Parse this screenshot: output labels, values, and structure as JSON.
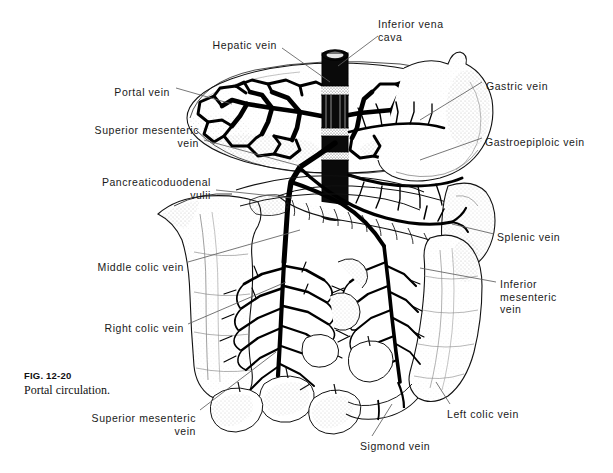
{
  "figure": {
    "number": "FIG. 12-20",
    "title": "Portal circulation."
  },
  "colors": {
    "ink": "#000000",
    "background": "#ffffff",
    "leader": "#6b6b6b",
    "stipple": "#5a5a5a"
  },
  "labels": [
    {
      "id": "inferior-vena-cava",
      "text": "Inferior vena\ncava",
      "x": 378,
      "y": 18,
      "align": "left"
    },
    {
      "id": "hepatic-vein",
      "text": "Hepatic vein",
      "x": 277,
      "y": 39,
      "align": "right"
    },
    {
      "id": "portal-vein",
      "text": "Portal vein",
      "x": 170,
      "y": 86,
      "align": "right"
    },
    {
      "id": "superior-mesenteric-vein-top",
      "text": "Superior mesenteric\nvein",
      "x": 199,
      "y": 124,
      "align": "right"
    },
    {
      "id": "pancreaticoduodenal-veins",
      "text": "Pancreaticoduodenal\nvulii",
      "x": 211,
      "y": 176,
      "align": "right"
    },
    {
      "id": "middle-colic-vein",
      "text": "Middle colic vein",
      "x": 184,
      "y": 261,
      "align": "right"
    },
    {
      "id": "right-colic-vein",
      "text": "Right colic vein",
      "x": 184,
      "y": 322,
      "align": "right"
    },
    {
      "id": "superior-mesenteric-vein-bottom",
      "text": "Superior mesenteric\nvein",
      "x": 196,
      "y": 412,
      "align": "right"
    },
    {
      "id": "sigmond-vein",
      "text": "Sigmond vein",
      "x": 360,
      "y": 440,
      "align": "left"
    },
    {
      "id": "left-colic-vein",
      "text": "Left colic vein",
      "x": 447,
      "y": 408,
      "align": "left"
    },
    {
      "id": "inferior-mesenteric-vein",
      "text": "Inferior\nmesenteric\nvein",
      "x": 500,
      "y": 278,
      "align": "left"
    },
    {
      "id": "splenic-vein",
      "text": "Splenic vein",
      "x": 497,
      "y": 231,
      "align": "left"
    },
    {
      "id": "gastroepiploic-vein",
      "text": "Gastroepiploic vein",
      "x": 485,
      "y": 136,
      "align": "left"
    },
    {
      "id": "gastric-vein",
      "text": "Gastric vein",
      "x": 486,
      "y": 80,
      "align": "left"
    }
  ],
  "illustration": {
    "type": "anatomical-line-drawing",
    "subject": "portal venous circulation",
    "structures": [
      "liver",
      "inferior vena cava",
      "hepatic veins",
      "portal vein",
      "stomach",
      "pancreas",
      "spleen",
      "duodenum",
      "ascending colon",
      "transverse colon",
      "descending colon",
      "sigmoid colon",
      "small intestine",
      "superior mesenteric vein",
      "inferior mesenteric vein",
      "splenic vein"
    ]
  }
}
